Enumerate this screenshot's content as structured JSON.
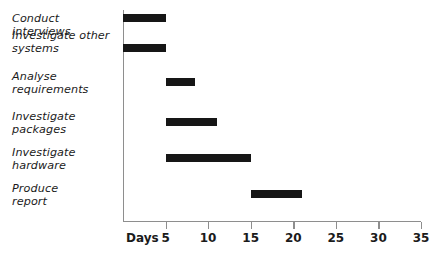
{
  "chart_data": {
    "type": "bar",
    "chart_style": "gantt",
    "title": "",
    "xlabel": "Days",
    "ylabel": "",
    "xlim": [
      0,
      35
    ],
    "xticks": [
      5,
      10,
      15,
      20,
      25,
      30,
      35
    ],
    "xtick_labels": [
      "5",
      "10",
      "15",
      "20",
      "25",
      "30",
      "35"
    ],
    "grid": false,
    "legend": false,
    "categories": [
      "Conduct interviews",
      "Investigate other systems",
      "Analyse requirements",
      "Investigate packages",
      "Investigate hardware",
      "Produce report"
    ],
    "tasks": [
      {
        "name": "Conduct interviews",
        "label_lines": "Conduct interviews",
        "start": 0,
        "end": 5,
        "duration": 5
      },
      {
        "name": "Investigate other systems",
        "label_lines": "Investigate other\nsystems",
        "start": 0,
        "end": 5,
        "duration": 5
      },
      {
        "name": "Analyse requirements",
        "label_lines": "Analyse\nrequirements",
        "start": 5,
        "end": 8.5,
        "duration": 3.5
      },
      {
        "name": "Investigate packages",
        "label_lines": "Investigate\npackages",
        "start": 5,
        "end": 11,
        "duration": 6
      },
      {
        "name": "Investigate hardware",
        "label_lines": "Investigate\nhardware",
        "start": 5,
        "end": 15,
        "duration": 10
      },
      {
        "name": "Produce report",
        "label_lines": "Produce\nreport",
        "start": 15,
        "end": 21,
        "duration": 6
      }
    ],
    "colors": {
      "bar": "#161616",
      "axis": "#8e8e8e",
      "text": "#1b1b1b",
      "background": "#ffffff"
    }
  },
  "labels": {
    "task_0": "Conduct interviews",
    "task_1": "Investigate other\nsystems",
    "task_2": "Analyse\nrequirements",
    "task_3": "Investigate\npackages",
    "task_4": "Investigate\nhardware",
    "task_5": "Produce\nreport",
    "days": "Days",
    "tick_5": "5",
    "tick_10": "10",
    "tick_15": "15",
    "tick_20": "20",
    "tick_25": "25",
    "tick_30": "30",
    "tick_35": "35"
  },
  "geometry": {
    "axis_x": 123,
    "axis_right": 421,
    "px_per_day": 8.514,
    "label_tops": [
      13,
      30,
      71,
      111,
      147,
      183
    ],
    "bar_tops": [
      14,
      44,
      78,
      118,
      154,
      190
    ]
  }
}
